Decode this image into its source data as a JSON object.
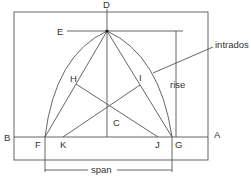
{
  "diagram": {
    "labels": {
      "D": "D",
      "E": "E",
      "H": "H",
      "I": "I",
      "C": "C",
      "B": "B",
      "F": "F",
      "K": "K",
      "J": "J",
      "G": "G",
      "A": "A"
    },
    "annotations": {
      "intrados": "intrados",
      "rise": "rise",
      "span": "span"
    },
    "colors": {
      "line": "#555555",
      "text": "#333333",
      "background": "#ffffff"
    }
  }
}
